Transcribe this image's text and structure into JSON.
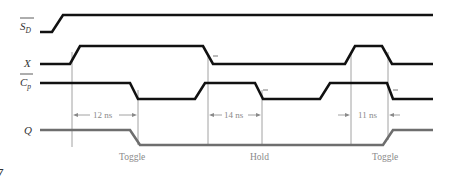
{
  "diagram": {
    "type": "timing-diagram",
    "signals": [
      {
        "id": "sd",
        "label": "S",
        "subscript": "D",
        "overbar": true,
        "points": [
          [
            40,
            32
          ],
          [
            52,
            32
          ],
          [
            63,
            15
          ],
          [
            433,
            15
          ]
        ]
      },
      {
        "id": "x",
        "label": "X",
        "subscript": "",
        "overbar": false,
        "points": [
          [
            40,
            64
          ],
          [
            70,
            64
          ],
          [
            80,
            46
          ],
          [
            203,
            46
          ],
          [
            213,
            64
          ],
          [
            345,
            64
          ],
          [
            355,
            46
          ],
          [
            382,
            46
          ],
          [
            392,
            64
          ],
          [
            433,
            64
          ]
        ]
      },
      {
        "id": "cp",
        "label": "C",
        "subscript": "p",
        "overbar": true,
        "points": [
          [
            40,
            83
          ],
          [
            130,
            83
          ],
          [
            138,
            99
          ],
          [
            195,
            99
          ],
          [
            205,
            83
          ],
          [
            255,
            83
          ],
          [
            263,
            99
          ],
          [
            320,
            99
          ],
          [
            330,
            83
          ],
          [
            387,
            83
          ],
          [
            393,
            99
          ],
          [
            433,
            99
          ]
        ]
      },
      {
        "id": "q",
        "label": "Q",
        "subscript": "",
        "overbar": false,
        "points": [
          [
            40,
            130
          ],
          [
            130,
            130
          ],
          [
            140,
            145
          ],
          [
            383,
            145
          ],
          [
            393,
            130
          ],
          [
            433,
            130
          ]
        ]
      }
    ],
    "guide_lines": [
      72,
      138,
      208,
      262,
      351,
      388
    ],
    "measurements": [
      {
        "label": "12 ns",
        "from": 72,
        "to": 138,
        "style": "inside"
      },
      {
        "label": "14 ns",
        "from": 208,
        "to": 262,
        "style": "inside"
      },
      {
        "label": "11 ns",
        "from": 351,
        "to": 388,
        "style": "outside"
      }
    ],
    "annotations": [
      {
        "text": "Toggle",
        "x": 135
      },
      {
        "text": "Hold",
        "x": 260
      },
      {
        "text": "Toggle",
        "x": 390
      }
    ],
    "figure_fragment": "7"
  },
  "labels": {
    "sd_main": "S",
    "sd_sub": "D",
    "x": "X",
    "cp_main": "C",
    "cp_sub": "p",
    "q": "Q",
    "m1": "12 ns",
    "m2": "14 ns",
    "m3": "11 ns",
    "a1": "Toggle",
    "a2": "Hold",
    "a3": "Toggle",
    "fig": "7"
  }
}
